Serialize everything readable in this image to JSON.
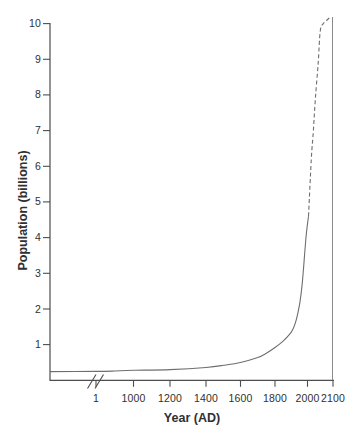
{
  "figure": {
    "background": "#ffffff",
    "y_axis": {
      "label": "Population (billions)",
      "ticks": [
        "10",
        "9",
        "8",
        "7",
        "6",
        "5",
        "4",
        "3",
        "2",
        "1"
      ]
    },
    "x_axis": {
      "label": "Year (AD)",
      "ticks": [
        "1",
        "1000",
        "1200",
        "1400",
        "1600",
        "1800",
        "2000",
        "2100"
      ],
      "has_break": true
    },
    "colors": {
      "axis": "#4d4d4d",
      "curve": "#6e6e6e",
      "reference_line": "#8a8a8a",
      "text": "#303030"
    }
  },
  "chart_data": {
    "type": "line",
    "title": "",
    "xlabel": "Year (AD)",
    "ylabel": "Population (billions)",
    "ylim": [
      0,
      10
    ],
    "x_ticks": [
      1,
      1000,
      1200,
      1400,
      1600,
      1800,
      2000,
      2100
    ],
    "y_ticks": [
      1,
      2,
      3,
      4,
      5,
      6,
      7,
      8,
      9,
      10
    ],
    "grid": false,
    "legend": false,
    "annotations": [
      "axis break (double slash) on x-axis between origin and year 1",
      "vertical reference line at year 2100 reaching population 10",
      "curve is solid for historical values, dashed for projection"
    ],
    "series": [
      {
        "name": "historical population (solid)",
        "style": "solid",
        "points": [
          [
            1,
            0.25
          ],
          [
            500,
            0.26
          ],
          [
            1000,
            0.28
          ],
          [
            1200,
            0.3
          ],
          [
            1400,
            0.36
          ],
          [
            1500,
            0.42
          ],
          [
            1600,
            0.5
          ],
          [
            1700,
            0.64
          ],
          [
            1750,
            0.76
          ],
          [
            1800,
            0.92
          ],
          [
            1850,
            1.1
          ],
          [
            1900,
            1.35
          ],
          [
            1925,
            1.6
          ],
          [
            1950,
            2.1
          ],
          [
            1965,
            2.6
          ],
          [
            1975,
            3.1
          ],
          [
            1985,
            3.7
          ],
          [
            1995,
            4.2
          ],
          [
            2004,
            4.6
          ]
        ]
      },
      {
        "name": "projected population (dashed)",
        "style": "dashed",
        "points": [
          [
            2004,
            4.6
          ],
          [
            2015,
            6.2
          ],
          [
            2023,
            7.0
          ],
          [
            2031,
            7.9
          ],
          [
            2042,
            8.9
          ],
          [
            2050,
            9.8
          ],
          [
            2062,
            10.0
          ],
          [
            2077,
            10.1
          ],
          [
            2092,
            10.2
          ]
        ]
      }
    ]
  }
}
